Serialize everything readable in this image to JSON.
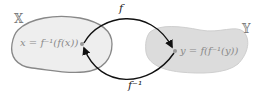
{
  "diagram": {
    "domain_set": {
      "label": "𝕏",
      "expression": "x = f⁻¹(f(x))"
    },
    "codomain_set": {
      "label": "𝕐",
      "expression": "y = f(f⁻¹(y))"
    },
    "forward_map": {
      "label": "f"
    },
    "inverse_map": {
      "label": "f⁻¹"
    }
  },
  "colors": {
    "domain_fill": "#eeeeee",
    "domain_stroke": "#888888",
    "codomain_fill": "#dcdcdc",
    "codomain_stroke": "#c8c8c8",
    "arrow": "#111111",
    "text": "#8a8a8a"
  }
}
